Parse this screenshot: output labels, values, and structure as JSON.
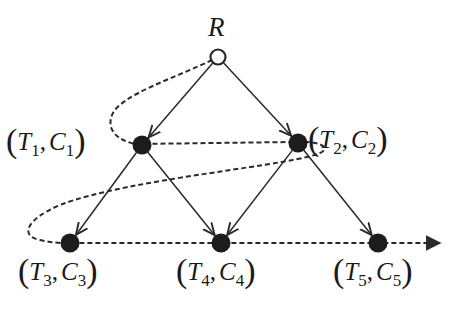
{
  "diagram": {
    "type": "tree-traversal",
    "colors": {
      "edge": "#2a2a2a",
      "node_fill": "#1c1c1c",
      "root_fill": "#ffffff",
      "path": "#2a2a2a",
      "text": "#1a1a1a"
    },
    "root": {
      "id": "R",
      "label": "R",
      "x": 218,
      "y": 57,
      "style": "hollow"
    },
    "nodes": [
      {
        "id": "n1",
        "t": "T",
        "t_sub": "1",
        "c": "C",
        "c_sub": "1",
        "x": 142,
        "y": 145
      },
      {
        "id": "n2",
        "t": "T",
        "t_sub": "2",
        "c": "C",
        "c_sub": "2",
        "x": 298,
        "y": 143
      },
      {
        "id": "n3",
        "t": "T",
        "t_sub": "3",
        "c": "C",
        "c_sub": "3",
        "x": 70,
        "y": 243
      },
      {
        "id": "n4",
        "t": "T",
        "t_sub": "4",
        "c": "C",
        "c_sub": "4",
        "x": 221,
        "y": 243
      },
      {
        "id": "n5",
        "t": "T",
        "t_sub": "5",
        "c": "C",
        "c_sub": "5",
        "x": 378,
        "y": 243
      }
    ],
    "edges": [
      {
        "from": "R",
        "to": "n1"
      },
      {
        "from": "R",
        "to": "n2"
      },
      {
        "from": "n1",
        "to": "n3"
      },
      {
        "from": "n1",
        "to": "n4"
      },
      {
        "from": "n2",
        "to": "n4"
      },
      {
        "from": "n2",
        "to": "n5"
      }
    ],
    "traversal_path": {
      "style": "dashed",
      "order": [
        "R",
        "n1",
        "n2",
        "n3",
        "n4",
        "n5"
      ],
      "ends_with_arrow": true
    }
  }
}
